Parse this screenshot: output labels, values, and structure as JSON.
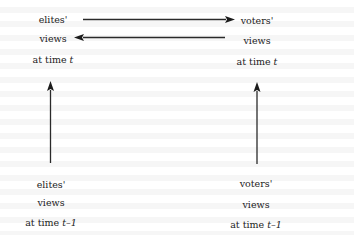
{
  "diagram": {
    "type": "influence-diagram",
    "nodes": {
      "elites_t": {
        "line1": "elites'",
        "line2": "views",
        "line3_prefix": "at time ",
        "line3_var": "t"
      },
      "voters_t": {
        "line1": "voters'",
        "line2": "views",
        "line3_prefix": "at time ",
        "line3_var": "t"
      },
      "elites_t_minus_1": {
        "line1": "elites'",
        "line2": "views",
        "line3_prefix": "at time ",
        "line3_var": "t–1"
      },
      "voters_t_minus_1": {
        "line1": "voters'",
        "line2": "views",
        "line3_prefix": "at time ",
        "line3_var": "t–1"
      }
    },
    "edges": [
      {
        "from": "elites_t",
        "to": "voters_t"
      },
      {
        "from": "voters_t",
        "to": "elites_t"
      },
      {
        "from": "elites_t_minus_1",
        "to": "elites_t"
      },
      {
        "from": "voters_t_minus_1",
        "to": "voters_t"
      }
    ],
    "colors": {
      "ink": "#1c1c1c",
      "arrow": "#2a2a2a",
      "background": "#ffffff"
    }
  }
}
